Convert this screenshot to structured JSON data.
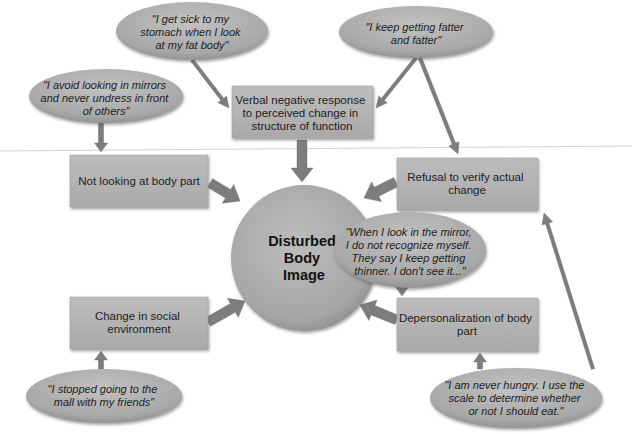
{
  "center": {
    "lines": [
      "Disturbed",
      "Body",
      "Image"
    ]
  },
  "boxes": [
    {
      "id": "verbal",
      "lines": [
        "Verbal negative response",
        "to perceived change in",
        "structure of function"
      ]
    },
    {
      "id": "not-looking",
      "lines": [
        "Not looking at body part"
      ]
    },
    {
      "id": "refusal",
      "lines": [
        "Refusal to verify actual",
        "change"
      ]
    },
    {
      "id": "social",
      "lines": [
        "Change in social",
        "environment"
      ]
    },
    {
      "id": "depersonalization",
      "lines": [
        "Depersonalization of body",
        "part"
      ]
    }
  ],
  "quotes": [
    {
      "id": "stomach",
      "lines": [
        "\"I get sick to my",
        "stomach when I look",
        "at my fat body\""
      ]
    },
    {
      "id": "fatter",
      "lines": [
        "\"I keep getting fatter",
        "and fatter\""
      ]
    },
    {
      "id": "mirrors",
      "lines": [
        "\"I avoid looking in mirrors",
        "and never undress in front",
        "of others\""
      ]
    },
    {
      "id": "recognize",
      "lines": [
        "\"When I look in the mirror,",
        "I do not recognize myself.",
        "They say I keep getting",
        "thinner. I don't see it...\""
      ]
    },
    {
      "id": "mall",
      "lines": [
        "\"I stopped going to the",
        "mall with my friends\""
      ]
    },
    {
      "id": "hungry",
      "lines": [
        "\"I am never hungry. I use the",
        "scale to determine whether",
        "or not I should eat.\""
      ]
    }
  ],
  "connections": [
    {
      "from": "stomach",
      "to": "verbal"
    },
    {
      "from": "fatter",
      "to": "verbal"
    },
    {
      "from": "fatter",
      "to": "refusal"
    },
    {
      "from": "mirrors",
      "to": "not-looking"
    },
    {
      "from": "verbal",
      "to": "center"
    },
    {
      "from": "not-looking",
      "to": "center"
    },
    {
      "from": "refusal",
      "to": "center"
    },
    {
      "from": "social",
      "to": "center"
    },
    {
      "from": "depersonalization",
      "to": "center"
    },
    {
      "from": "recognize",
      "to": "refusal"
    },
    {
      "from": "recognize",
      "to": "depersonalization"
    },
    {
      "from": "mall",
      "to": "social"
    },
    {
      "from": "hungry",
      "to": "depersonalization"
    },
    {
      "from": "hungry",
      "to": "refusal"
    }
  ],
  "colors": {
    "fill": "#a9a9a9",
    "fill_light": "#c4c4c4",
    "shadow": "#6e6e6e",
    "arrow": "#7d7d7d",
    "rule_line": "#d0d0d0"
  }
}
